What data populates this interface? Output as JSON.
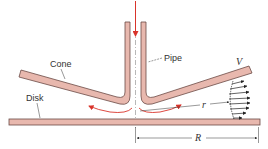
{
  "figure": {
    "type": "cross-section diagram"
  },
  "labels": {
    "cone": "Cone",
    "pipe": "Pipe",
    "disk": "Disk",
    "velocity": "V",
    "radius_local": "r",
    "radius_outer": "R"
  },
  "colors": {
    "solid_fill": "#e8b8ae",
    "solid_outline": "#6b4a45",
    "flow_arrow": "#d9342b",
    "annotation": "#333333",
    "centerline": "#9a9a9a"
  },
  "elements": {
    "pipe": "vertical pipe feeding fluid downward along centerline",
    "cone": "conical plate flaring outward from pipe exit",
    "disk": "flat horizontal disk below the cone",
    "velocity_profile": "velocity arrows across the gap at radius r",
    "dimension_R": "outer radius measured from centerline to disk edge"
  }
}
